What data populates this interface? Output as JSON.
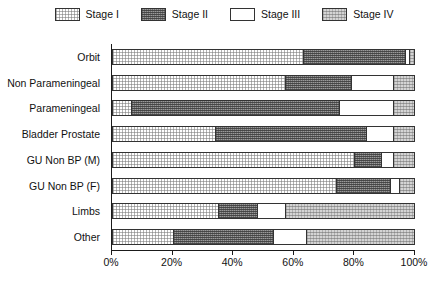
{
  "chart_data": {
    "type": "bar",
    "subtype": "stacked-horizontal-100pct",
    "title": "",
    "xlabel": "",
    "ylabel": "",
    "xlim": [
      0,
      100
    ],
    "xticks": [
      0,
      20,
      40,
      60,
      80,
      100
    ],
    "xtick_labels": [
      "0%",
      "20%",
      "40%",
      "60%",
      "80%",
      "100%"
    ],
    "grid": false,
    "legend_position": "top-center",
    "categories": [
      "Orbit",
      "Non Parameningeal",
      "Parameningeal",
      "Bladder Prostate",
      "GU Non BP (M)",
      "GU Non BP (F)",
      "Limbs",
      "Other"
    ],
    "series": [
      {
        "name": "Stage I",
        "pattern": "fine-dotted-white",
        "values": [
          63,
          57,
          6,
          34,
          80,
          74,
          35,
          20
        ]
      },
      {
        "name": "Stage II",
        "pattern": "dense-dark-checker",
        "values": [
          34,
          22,
          69,
          50,
          9,
          18,
          13,
          33
        ]
      },
      {
        "name": "Stage III",
        "pattern": "solid-white",
        "values": [
          1.5,
          14,
          18,
          9,
          4,
          3,
          9,
          11
        ]
      },
      {
        "name": "Stage IV",
        "pattern": "light-checker",
        "values": [
          1.5,
          7,
          7,
          7,
          7,
          5,
          43,
          36
        ]
      }
    ]
  },
  "legend": {
    "items": [
      {
        "label": "Stage I",
        "swatch": "stage-1-swatch"
      },
      {
        "label": "Stage II",
        "swatch": "stage-2-swatch"
      },
      {
        "label": "Stage III",
        "swatch": "stage-3-swatch"
      },
      {
        "label": "Stage IV",
        "swatch": "stage-4-swatch"
      }
    ]
  }
}
